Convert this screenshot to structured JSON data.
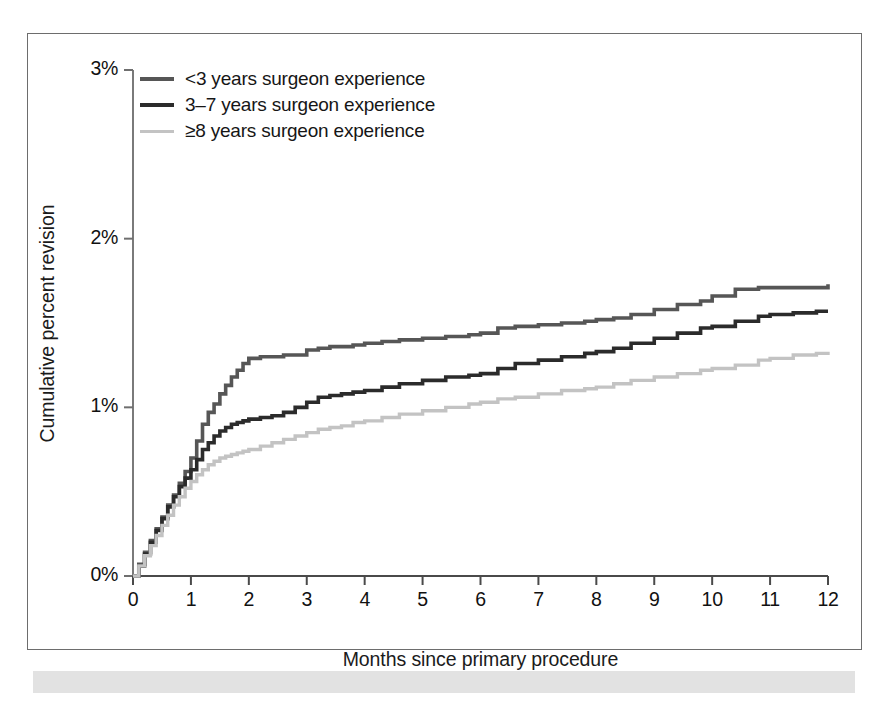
{
  "figure": {
    "border_color": "#6d6d6d",
    "caption_bar_color": "#e2e2e2"
  },
  "legend": {
    "items": [
      {
        "label": "<3 years surgeon experience",
        "color": "#565656"
      },
      {
        "label": "3–7 years surgeon experience",
        "color": "#2b2b2b"
      },
      {
        "label": "≥8 years surgeon experience",
        "color": "#c3c3c3"
      }
    ]
  },
  "chart_data": {
    "type": "line",
    "title": "",
    "subtitle": "",
    "xlabel": "Months since primary procedure",
    "ylabel": "Cumulative percent revision",
    "xlim": [
      0,
      12
    ],
    "ylim": [
      0,
      3
    ],
    "xticks": [
      0,
      1,
      2,
      3,
      4,
      5,
      6,
      7,
      8,
      9,
      10,
      11,
      12
    ],
    "xtick_labels": [
      "0",
      "1",
      "2",
      "3",
      "4",
      "5",
      "6",
      "7",
      "8",
      "9",
      "10",
      "11",
      "12"
    ],
    "yticks": [
      0,
      1,
      2,
      3
    ],
    "ytick_labels": [
      "0%",
      "1%",
      "2%",
      "3%"
    ],
    "grid": false,
    "legend_position": "top-left",
    "line_style": "step",
    "x": [
      0,
      0.1,
      0.2,
      0.3,
      0.4,
      0.5,
      0.6,
      0.7,
      0.8,
      0.9,
      1.0,
      1.1,
      1.2,
      1.3,
      1.4,
      1.5,
      1.6,
      1.7,
      1.8,
      1.9,
      2.0,
      2.2,
      2.4,
      2.6,
      2.8,
      3.0,
      3.2,
      3.4,
      3.6,
      3.8,
      4.0,
      4.3,
      4.6,
      5.0,
      5.4,
      5.8,
      6.0,
      6.3,
      6.6,
      7.0,
      7.4,
      7.8,
      8.0,
      8.3,
      8.6,
      9.0,
      9.4,
      9.8,
      10.0,
      10.4,
      10.8,
      11.0,
      11.4,
      11.8,
      12.0
    ],
    "series": [
      {
        "name": "<3 years surgeon experience",
        "color": "#565656",
        "values": [
          0.0,
          0.07,
          0.14,
          0.21,
          0.28,
          0.35,
          0.42,
          0.48,
          0.55,
          0.62,
          0.7,
          0.8,
          0.9,
          0.97,
          1.02,
          1.08,
          1.13,
          1.18,
          1.22,
          1.26,
          1.29,
          1.3,
          1.3,
          1.31,
          1.31,
          1.34,
          1.35,
          1.36,
          1.36,
          1.37,
          1.38,
          1.39,
          1.4,
          1.41,
          1.42,
          1.43,
          1.44,
          1.47,
          1.48,
          1.49,
          1.5,
          1.51,
          1.52,
          1.53,
          1.55,
          1.58,
          1.61,
          1.63,
          1.66,
          1.7,
          1.71,
          1.71,
          1.71,
          1.71,
          1.73
        ]
      },
      {
        "name": "3–7 years surgeon experience",
        "color": "#2b2b2b",
        "values": [
          0.0,
          0.06,
          0.13,
          0.2,
          0.27,
          0.34,
          0.41,
          0.47,
          0.53,
          0.58,
          0.63,
          0.69,
          0.75,
          0.79,
          0.83,
          0.86,
          0.88,
          0.9,
          0.91,
          0.92,
          0.93,
          0.94,
          0.95,
          0.97,
          1.0,
          1.03,
          1.06,
          1.07,
          1.08,
          1.09,
          1.1,
          1.12,
          1.14,
          1.16,
          1.18,
          1.19,
          1.2,
          1.23,
          1.26,
          1.28,
          1.3,
          1.32,
          1.33,
          1.35,
          1.38,
          1.41,
          1.44,
          1.47,
          1.48,
          1.51,
          1.54,
          1.55,
          1.56,
          1.57,
          1.57
        ]
      },
      {
        "name": "≥8 years surgeon experience",
        "color": "#c3c3c3",
        "values": [
          0.0,
          0.06,
          0.12,
          0.18,
          0.24,
          0.3,
          0.36,
          0.42,
          0.47,
          0.52,
          0.56,
          0.6,
          0.63,
          0.66,
          0.68,
          0.7,
          0.71,
          0.72,
          0.73,
          0.74,
          0.75,
          0.77,
          0.79,
          0.81,
          0.83,
          0.85,
          0.87,
          0.88,
          0.89,
          0.91,
          0.92,
          0.94,
          0.96,
          0.98,
          1.0,
          1.02,
          1.03,
          1.05,
          1.06,
          1.08,
          1.1,
          1.11,
          1.12,
          1.14,
          1.16,
          1.18,
          1.2,
          1.22,
          1.23,
          1.25,
          1.28,
          1.29,
          1.31,
          1.32,
          1.33
        ]
      }
    ]
  }
}
